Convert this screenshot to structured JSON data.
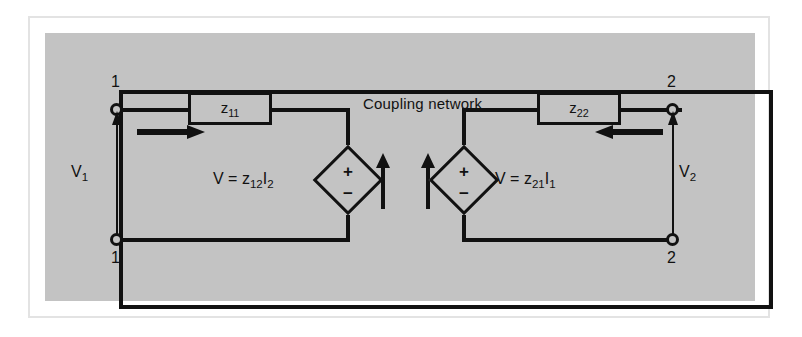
{
  "figure": {
    "title": "Coupling network",
    "background_color": "#c3c3c3",
    "line_color": "#111111",
    "page_color": "#ffffff"
  },
  "ports": {
    "left": {
      "top_terminal_label": "1",
      "bottom_terminal_label": "1",
      "voltage_label": "V₁",
      "voltage_label_base": "V",
      "voltage_label_sub": "1",
      "current_label_base": "I",
      "current_label_sub": "1",
      "current_direction": "right"
    },
    "right": {
      "top_terminal_label": "2",
      "bottom_terminal_label": "2",
      "voltage_label": "V₂",
      "voltage_label_base": "V",
      "voltage_label_sub": "2",
      "current_label_base": "I",
      "current_label_sub": "2",
      "current_direction": "left"
    }
  },
  "impedances": [
    {
      "name": "z11",
      "base": "z",
      "sub": "11",
      "side": "left"
    },
    {
      "name": "z22",
      "base": "z",
      "sub": "22",
      "side": "right"
    }
  ],
  "sources": [
    {
      "name": "left-dependent-source",
      "equation_prefix": "V  =  ",
      "coefficient_base": "z",
      "coefficient_sub": "12",
      "current_base": "I",
      "current_sub": "2",
      "plus_sign": "+",
      "minus_sign": "−",
      "equation_full": "V = z₁₂I₂"
    },
    {
      "name": "right-dependent-source",
      "equation_prefix": "V  =  ",
      "coefficient_base": "z",
      "coefficient_sub": "21",
      "current_base": "I",
      "current_sub": "1",
      "plus_sign": "+",
      "minus_sign": "−",
      "equation_full": "V = z₂₁I₁"
    }
  ],
  "reference_arrows": [
    {
      "name": "left-source-reference-arrow",
      "direction": "up"
    },
    {
      "name": "right-source-reference-arrow",
      "direction": "up"
    }
  ]
}
